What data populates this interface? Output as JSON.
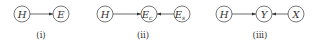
{
  "diagrams": [
    {
      "caption": "(i)",
      "nodes": [
        {
          "id": "H",
          "label": "H",
          "sub": ""
        },
        {
          "id": "E",
          "label": "E",
          "sub": ""
        }
      ],
      "edges": [
        {
          "from": "H",
          "to": "E"
        }
      ]
    },
    {
      "caption": "(ii)",
      "nodes": [
        {
          "id": "H",
          "label": "H",
          "sub": ""
        },
        {
          "id": "Ec",
          "label": "E",
          "sub": "c"
        },
        {
          "id": "Es",
          "label": "E",
          "sub": "s"
        }
      ],
      "edges": [
        {
          "from": "H",
          "to": "Ec"
        },
        {
          "from": "Es",
          "to": "Ec"
        }
      ]
    },
    {
      "caption": "(iii)",
      "nodes": [
        {
          "id": "H",
          "label": "H",
          "sub": ""
        },
        {
          "id": "Y",
          "label": "Y",
          "sub": ""
        },
        {
          "id": "X",
          "label": "X",
          "sub": ""
        }
      ],
      "edges": [
        {
          "from": "H",
          "to": "Y"
        },
        {
          "from": "X",
          "to": "Y"
        }
      ]
    }
  ]
}
